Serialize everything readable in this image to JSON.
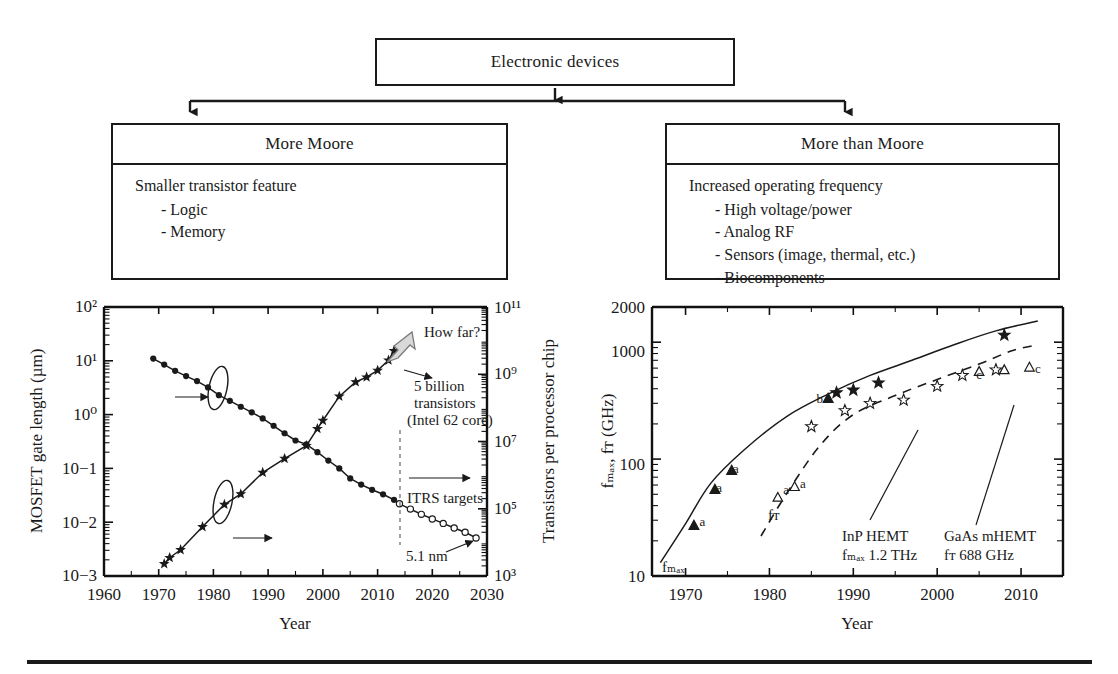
{
  "flow": {
    "root": {
      "label": "Electronic devices"
    },
    "left": {
      "title": "More Moore",
      "lead": "Smaller transistor feature",
      "items": [
        "- Logic",
        "- Memory"
      ]
    },
    "right": {
      "title": "More than Moore",
      "lead": "Increased operating frequency",
      "items": [
        "- High voltage/power",
        "- Analog RF",
        "- Sensors (image, thermal, etc.)",
        "- Biocomponents"
      ]
    }
  },
  "chart_data": [
    {
      "id": "moore",
      "type": "line",
      "title": "",
      "xlabel": "Year",
      "ylabel_left": "MOSFET gate length (µm)",
      "ylabel_right": "Transistors per processor chip",
      "xlim": [
        1960,
        2030
      ],
      "xticks": [
        1960,
        1970,
        1980,
        1990,
        2000,
        2010,
        2020,
        2030
      ],
      "xticklabels": [
        "1960",
        "1970",
        "1980",
        "1990",
        "2000",
        "2010",
        "2020",
        "2030"
      ],
      "ylim_left_log10": [
        -3,
        2
      ],
      "yticklabels_left": [
        "10−3",
        "10−2",
        "10−1",
        "10⁰",
        "10¹",
        "10²"
      ],
      "ylim_right_log10": [
        3,
        11
      ],
      "yticklabels_right": [
        "10³",
        "10⁵",
        "10⁷",
        "10⁹",
        "10¹¹"
      ],
      "grid": false,
      "annotations": [
        {
          "text": "How far?",
          "x": 2016,
          "y": 20000000000.0
        },
        {
          "text": "5 billion",
          "x": 2014,
          "y": 1100000000.0
        },
        {
          "text": "transistors",
          "x": 2014,
          "y": 400000000.0
        },
        {
          "text": "(Intel 62 core)",
          "x": 2014,
          "y": 140000000.0
        },
        {
          "text": "ITRS targets",
          "x": 2018,
          "y": 200000.0
        },
        {
          "text": "5.1 nm",
          "x": 2019,
          "y": 5000.0
        }
      ],
      "series": [
        {
          "name": "MOSFET gate length (µm)",
          "axis": "left",
          "marker": "filled-circle",
          "x": [
            1969,
            1971,
            1973,
            1975,
            1977,
            1979,
            1981,
            1983,
            1985,
            1987,
            1989,
            1991,
            1993,
            1995,
            1997,
            1999,
            2001,
            2003,
            2005,
            2007,
            2009,
            2011,
            2013,
            2014
          ],
          "y": [
            11,
            8.5,
            6.5,
            5.2,
            4.2,
            3.2,
            2.3,
            1.8,
            1.4,
            1.1,
            0.85,
            0.62,
            0.45,
            0.33,
            0.28,
            0.2,
            0.14,
            0.1,
            0.065,
            0.05,
            0.04,
            0.033,
            0.026,
            0.022
          ]
        },
        {
          "name": "ITRS projected gate length (µm)",
          "axis": "left",
          "marker": "open-circle",
          "x": [
            2014,
            2016,
            2018,
            2020,
            2022,
            2024,
            2026,
            2028
          ],
          "y": [
            0.022,
            0.0175,
            0.014,
            0.0115,
            0.0095,
            0.0078,
            0.0065,
            0.0051
          ]
        },
        {
          "name": "Transistors per processor chip",
          "axis": "right",
          "marker": "star",
          "x": [
            1971,
            1972,
            1974,
            1978,
            1982,
            1985,
            1989,
            1993,
            1997,
            1999,
            2000,
            2003,
            2006,
            2008,
            2010,
            2012,
            2013
          ],
          "y": [
            2300,
            3500,
            6000,
            29000,
            134000,
            275000,
            1200000.0,
            3100000.0,
            7500000.0,
            24000000.0,
            42000000.0,
            220000000.0,
            590000000.0,
            820000000.0,
            1300000000.0,
            2600000000.0,
            5000000000.0
          ]
        }
      ]
    },
    {
      "id": "hemt",
      "type": "scatter",
      "title": "",
      "xlabel": "Year",
      "ylabel": "fₘₐₓ, fᴛ (GHz)",
      "xlim": [
        1966,
        2015
      ],
      "xticks": [
        1970,
        1980,
        1990,
        2000,
        2010
      ],
      "xticklabels": [
        "1970",
        "1980",
        "1990",
        "2000",
        "2010"
      ],
      "ylim": [
        10,
        2000
      ],
      "yticks": [
        10,
        100,
        1000,
        2000
      ],
      "yticklabels": [
        "10",
        "100",
        "1000",
        "2000"
      ],
      "grid": false,
      "annotations": [
        {
          "text": "fₘₐₓ",
          "x": 1968,
          "y": 13
        },
        {
          "text": "fᴛ",
          "x": 1981,
          "y": 35
        },
        {
          "text": "InP HEMT",
          "x": 1991,
          "y": 26
        },
        {
          "text": "fₘₐₓ 1.2 THz",
          "x": 1991,
          "y": 19
        },
        {
          "text": "GaAs mHEMT",
          "x": 2002,
          "y": 26
        },
        {
          "text": "fᴛ 688 GHz",
          "x": 2002,
          "y": 19
        },
        {
          "text": "a",
          "x": 1972,
          "y": 27
        },
        {
          "text": "a",
          "x": 1974,
          "y": 52
        },
        {
          "text": "a",
          "x": 1976,
          "y": 76
        },
        {
          "text": "b",
          "x": 1986,
          "y": 300
        },
        {
          "text": "a",
          "x": 1982,
          "y": 50
        },
        {
          "text": "a",
          "x": 1984,
          "y": 57
        },
        {
          "text": "c",
          "x": 2005,
          "y": 480
        },
        {
          "text": "c",
          "x": 2012,
          "y": 550
        }
      ],
      "series": [
        {
          "name": "f_max envelope",
          "style": "solid-curve",
          "x": [
            1967,
            1970,
            1973,
            1977,
            1982,
            1987,
            1992,
            1997,
            2002,
            2007,
            2012
          ],
          "y": [
            13,
            28,
            62,
            120,
            230,
            360,
            520,
            700,
            950,
            1250,
            1520
          ]
        },
        {
          "name": "f_T envelope",
          "style": "dashed-curve",
          "x": [
            1979,
            1982,
            1986,
            1990,
            1995,
            2000,
            2005,
            2009,
            2012
          ],
          "y": [
            22,
            50,
            130,
            240,
            350,
            480,
            650,
            850,
            950
          ]
        },
        {
          "name": "f_max measured (filled triangle)",
          "marker": "filled-triangle",
          "x": [
            1971,
            1973.5,
            1975.5,
            1987
          ],
          "y": [
            27,
            55,
            80,
            330
          ]
        },
        {
          "name": "f_T measured (open triangle)",
          "marker": "open-triangle",
          "x": [
            1981,
            1983,
            2005,
            2008,
            2011
          ],
          "y": [
            47,
            58,
            560,
            580,
            610
          ]
        },
        {
          "name": "f_max HEMT (filled star)",
          "marker": "filled-star",
          "x": [
            1988,
            1990,
            1993,
            2008
          ],
          "y": [
            370,
            390,
            450,
            1150
          ]
        },
        {
          "name": "f_T HEMT (open star)",
          "marker": "open-star",
          "x": [
            1985,
            1989,
            1992,
            1996,
            2000,
            2003,
            2007
          ],
          "y": [
            190,
            260,
            300,
            320,
            420,
            520,
            580
          ]
        }
      ]
    }
  ]
}
